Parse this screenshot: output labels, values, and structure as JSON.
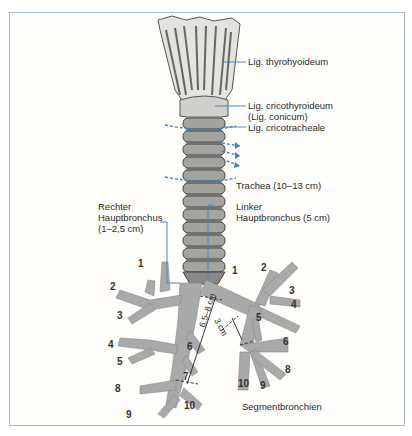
{
  "figure": {
    "labels": {
      "thyrohyoideum": "Lig. thyrohyoideum",
      "cricothyroideum_1": "Lig. cricothyroideum",
      "cricothyroideum_2": "(Lig. conicum)",
      "cricotracheale": "Lig. cricotracheale",
      "trachea": "Trachea (10–13 cm)",
      "right_main_1": "Rechter",
      "right_main_2": "Hauptbronchus",
      "right_main_3": "(1–2,5 cm)",
      "left_main_1": "Linker",
      "left_main_2": "Hauptbronchus (5 cm)",
      "segment_caption": "Segmentbronchien",
      "measure_long": "6,5–8 cm",
      "measure_short": "3 cm"
    },
    "right_segments": [
      "1",
      "2",
      "3",
      "4",
      "5",
      "6",
      "7",
      "8",
      "9",
      "10"
    ],
    "left_segments": [
      "1",
      "2",
      "3",
      "4",
      "5",
      "6",
      "8",
      "10",
      "9"
    ],
    "colors": {
      "frame": "#a9bccd",
      "leader": "#4a86c0",
      "airway_fill": "#a9a9a9",
      "arrow_blue": "#3a82c8"
    }
  }
}
